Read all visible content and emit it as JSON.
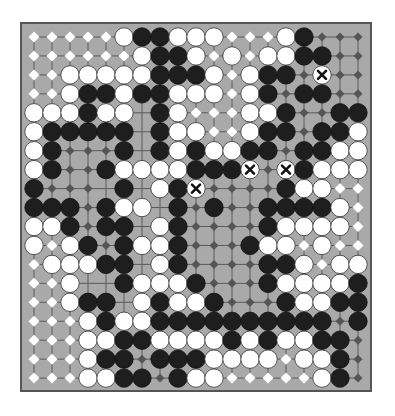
{
  "game": {
    "type": "go",
    "board_size": 19,
    "legend": {
      "W": "white-stone",
      "B": "black-stone",
      "X": "dead-white-stone-marked",
      "w": "white-territory",
      "b": "black-territory",
      ".": "empty"
    },
    "grid": [
      "wwwwwWBBWWWwwwWBbbb",
      "wwwwwwWBBWwWwWWBBbb",
      "wwWWWWWBBBWwWBBbXbb",
      "wwWBBWBBWWWwWBbBBbb",
      "WWWBWW.BWwwwWWBbbBB",
      "WBBBBB.BWWwwWBBbBBW",
      "WBbbbB.BWBWWBBbBBWW",
      "WBbbBWWWWBBBXbXBWWW",
      "Bbbb.B.WBXbbbbBWWww",
      "BBBbBWW.BbBbbBBBBWw",
      "WWBbBB.WBbbbbBWWWWw",
      "WwWBbBWWBbbbBWWwWww",
      "wWWWBB.WBbbbbBBWwWW",
      "wwW..BWWWBbbbBWWWWB",
      "wwWBB.WBWWBbbbBWWBB",
      "wwwWBWWBBBBBBBBBBbB",
      "wwwWWBBWWWWBWBWWBBb",
      "wwwWBBbBBBWWWWwWWBb",
      "wwwWWBBbBWWwwwwwWBb"
    ],
    "colors": {
      "board": "#a9a9a9",
      "border": "#555555",
      "grid_line": "#5a5a5a",
      "black_stone": "#1e1e1e",
      "white_stone": "#ffffff",
      "white_marker": "#ffffff",
      "black_marker": "#555555"
    },
    "dead_mark": "X"
  }
}
